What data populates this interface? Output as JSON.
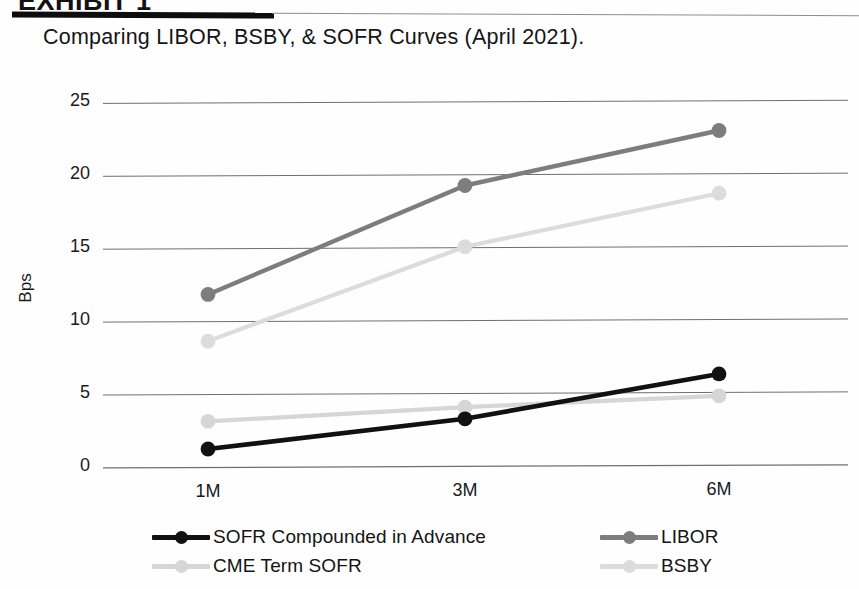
{
  "document": {
    "title_clipped": "EXHIBIT 1",
    "subtitle": "Comparing LIBOR, BSBY, & SOFR Curves (April 2021)."
  },
  "chart_data": {
    "type": "line",
    "title": "Comparing LIBOR, BSBY, & SOFR Curves (April 2021).",
    "xlabel": "",
    "ylabel": "Bps",
    "categories": [
      "1M",
      "3M",
      "6M"
    ],
    "x_tick_labels": [
      "1M",
      "3M",
      "6M"
    ],
    "y_tick_labels": [
      "0",
      "5",
      "10",
      "15",
      "20",
      "25"
    ],
    "y_ticks": [
      0,
      5,
      10,
      15,
      20,
      25
    ],
    "ylim": [
      0,
      26.2
    ],
    "grid": "horizontal",
    "legend_position": "bottom",
    "series": [
      {
        "name": "SOFR Compounded in Advance",
        "color": "#111111",
        "values": [
          1.1,
          3.1,
          6.1
        ]
      },
      {
        "name": "CME Term SOFR",
        "color": "#d6d6d6",
        "values": [
          3.0,
          3.9,
          4.6
        ]
      },
      {
        "name": "LIBOR",
        "color": "#7d7d7d",
        "values": [
          11.7,
          19.1,
          22.8
        ]
      },
      {
        "name": "BSBY",
        "color": "#dcdcdc",
        "values": [
          8.5,
          14.9,
          18.5
        ]
      }
    ]
  },
  "legend": {
    "items": [
      {
        "label": "SOFR Compounded in Advance",
        "color": "#111111"
      },
      {
        "label": "CME Term SOFR",
        "color": "#d6d6d6"
      },
      {
        "label": "LIBOR",
        "color": "#7d7d7d"
      },
      {
        "label": "BSBY",
        "color": "#dcdcdc"
      }
    ]
  },
  "colors": {
    "grid": "#6f6f6f",
    "text": "#1a1a1a",
    "background": "#ffffff"
  }
}
